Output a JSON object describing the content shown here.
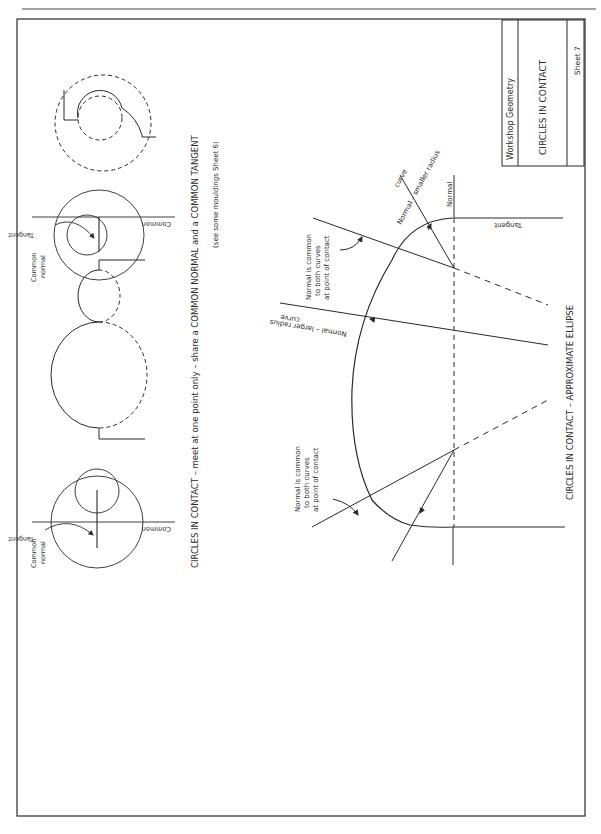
{
  "sheet": {
    "title_block": {
      "subject": "Workshop Geometry",
      "title": "CIRCLES IN CONTACT",
      "sheet_number": "Sheet 7"
    },
    "section_top": {
      "caption": "CIRCLES IN CONTACT – meet at one point only – share a COMMON NORMAL and a COMMON TANGENT",
      "subcaption": "(see some mouldings Sheet 6)",
      "figure1": {
        "common_normal": [
          "Common",
          "normal"
        ],
        "tangent_label": "Tangent",
        "common_label": "Common"
      },
      "figure3": {
        "common_normal": [
          "Common",
          "normal"
        ],
        "tangent_label": "Tangent",
        "common_label": "Common"
      }
    },
    "section_bottom": {
      "caption": "CIRCLES IN CONTACT – APPROXIMATE ELLIPSE",
      "normal_label": "Normal",
      "tangent_label": "Tangent",
      "smaller_radius": [
        "Normal – smaller radius",
        "curve"
      ],
      "larger_radius": [
        "Normal – larger radius",
        "curve"
      ],
      "note_upper": [
        "Normal is common",
        "to both curves",
        "at point of contact"
      ],
      "note_lower": [
        "Normal is common",
        "to both curves",
        "at point of contact"
      ]
    }
  }
}
